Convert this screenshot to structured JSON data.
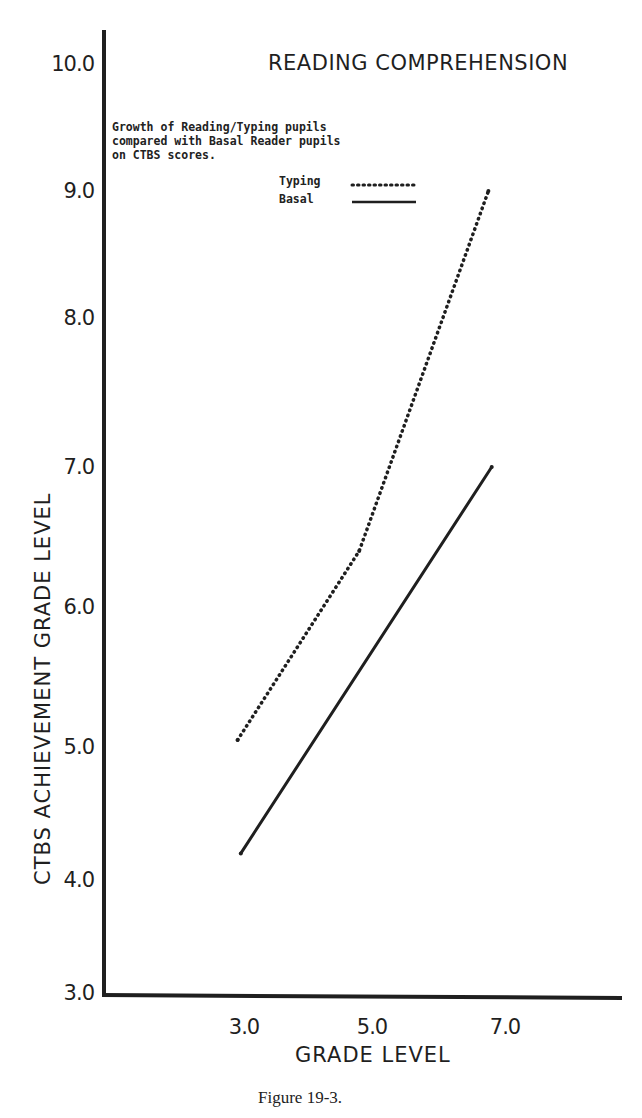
{
  "chart_data": {
    "type": "line",
    "title": "READING COMPREHENSION",
    "xlabel": "GRADE LEVEL",
    "ylabel": "CTBS ACHIEVEMENT GRADE LEVEL",
    "x_ticks": [
      "3.0",
      "5.0",
      "7.0"
    ],
    "x_tick_values": [
      3.0,
      5.0,
      7.0
    ],
    "y_ticks": [
      "3.0",
      "4.0",
      "5.0",
      "6.0",
      "7.0",
      "8.0",
      "9.0",
      "10.0"
    ],
    "y_tick_values": [
      3.0,
      4.0,
      5.0,
      6.0,
      7.0,
      8.0,
      9.0,
      10.0
    ],
    "xlim": [
      2.0,
      8.0
    ],
    "ylim": [
      3.0,
      10.0
    ],
    "grid": false,
    "annotation": [
      "Growth of Reading/Typing pupils",
      "compared with Basal Reader pupils",
      "on CTBS scores."
    ],
    "legend_position": "top-center",
    "series": [
      {
        "name": "Typing",
        "style": "dotted",
        "x": [
          2.9,
          4.8,
          6.75
        ],
        "y": [
          5.05,
          6.4,
          9.0
        ]
      },
      {
        "name": "Basal",
        "style": "solid",
        "x": [
          2.95,
          6.8
        ],
        "y": [
          4.2,
          7.0
        ]
      }
    ],
    "caption": "Figure 19-3."
  },
  "colors": {
    "ink": "#1f1f1f",
    "background": "#ffffff"
  }
}
